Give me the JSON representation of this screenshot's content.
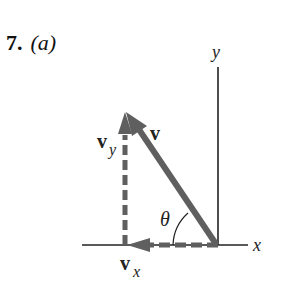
{
  "problem": {
    "number": "7.",
    "part": "(a)"
  },
  "axes": {
    "x_label": "x",
    "y_label": "y"
  },
  "vectors": {
    "v": {
      "label": "v",
      "style": "solid",
      "color": "#5f5f5f"
    },
    "vx": {
      "label": "v",
      "subscript": "x",
      "style": "dashed",
      "color": "#5f5f5f"
    },
    "vy": {
      "label": "v",
      "subscript": "y",
      "style": "dashed",
      "color": "#5f5f5f"
    }
  },
  "angle": {
    "label": "θ"
  }
}
